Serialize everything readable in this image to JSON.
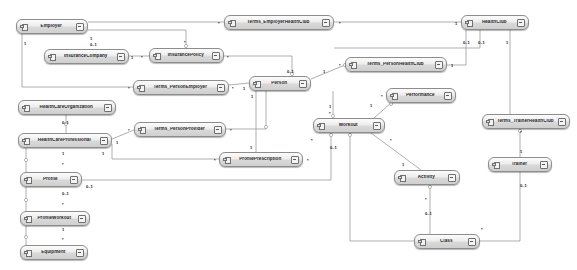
{
  "diagram": {
    "type": "uml-class-diagram",
    "canvas": {
      "width": 577,
      "height": 270,
      "background": "#ffffff"
    },
    "node_style": {
      "border": "#8d8d8d",
      "fill_top": "#fcfcfc",
      "fill_bottom": "#cfcfcf",
      "text": "#1d1d1d"
    },
    "edge_color": "#8c8c8c",
    "icons": {
      "class": "class-icon",
      "expand": "expand-icon"
    }
  },
  "nodes": [
    {
      "id": "employer",
      "label": "Employer",
      "x": 16,
      "y": 19,
      "w": 72
    },
    {
      "id": "terms_employerhealthclub",
      "label": "Terms_EmployerHealthClub",
      "x": 224,
      "y": 15,
      "w": 110
    },
    {
      "id": "healthclub",
      "label": "HealthClub",
      "x": 461,
      "y": 15,
      "w": 68
    },
    {
      "id": "insurancecompany",
      "label": "InsuranceCompany",
      "x": 44,
      "y": 49,
      "w": 85
    },
    {
      "id": "insurancepolicy",
      "label": "InsurancePolicy",
      "x": 149,
      "y": 48,
      "w": 75
    },
    {
      "id": "terms_personhealthclub",
      "label": "Terms_PersonHealthClub",
      "x": 345,
      "y": 57,
      "w": 102
    },
    {
      "id": "terms_personemployer",
      "label": "Terms_PersonEmployer",
      "x": 133,
      "y": 80,
      "w": 96
    },
    {
      "id": "person",
      "label": "Person",
      "x": 249,
      "y": 76,
      "w": 62
    },
    {
      "id": "performance",
      "label": "Performance",
      "x": 386,
      "y": 88,
      "w": 70
    },
    {
      "id": "healthcareorganization",
      "label": "HealthCareOrganization",
      "x": 18,
      "y": 100,
      "w": 98
    },
    {
      "id": "terms_trainerhealthclub",
      "label": "Terms_TrainerHealthClub",
      "x": 482,
      "y": 114,
      "w": 88
    },
    {
      "id": "workout",
      "label": "Workout",
      "x": 313,
      "y": 118,
      "w": 72
    },
    {
      "id": "terms_personprovider",
      "label": "Terms_PersonProvider",
      "x": 134,
      "y": 122,
      "w": 92
    },
    {
      "id": "healthcareprofessional",
      "label": "HealthCareProfessional",
      "x": 18,
      "y": 133,
      "w": 94
    },
    {
      "id": "profileprescription",
      "label": "ProfilePrescription",
      "x": 219,
      "y": 152,
      "w": 84
    },
    {
      "id": "profile",
      "label": "Profile",
      "x": 20,
      "y": 172,
      "w": 62
    },
    {
      "id": "trainer",
      "label": "Trainer",
      "x": 488,
      "y": 157,
      "w": 64
    },
    {
      "id": "activity",
      "label": "Activity",
      "x": 394,
      "y": 170,
      "w": 66
    },
    {
      "id": "profileworkout",
      "label": "ProfileWorkout",
      "x": 20,
      "y": 211,
      "w": 70
    },
    {
      "id": "class",
      "label": "Class",
      "x": 414,
      "y": 234,
      "w": 66
    },
    {
      "id": "equipment",
      "label": "Equipment",
      "x": 20,
      "y": 245,
      "w": 68
    }
  ],
  "multiplicities": [
    {
      "text": "1",
      "x": 90,
      "y": 37
    },
    {
      "text": "0..1",
      "x": 90,
      "y": 43
    },
    {
      "text": "1",
      "x": 24,
      "y": 42
    },
    {
      "text": "*",
      "x": 218,
      "y": 22
    },
    {
      "text": "*",
      "x": 339,
      "y": 22
    },
    {
      "text": "1",
      "x": 455,
      "y": 22
    },
    {
      "text": "*",
      "x": 184,
      "y": 41
    },
    {
      "text": "1",
      "x": 131,
      "y": 56
    },
    {
      "text": "*",
      "x": 141,
      "y": 56
    },
    {
      "text": "*",
      "x": 227,
      "y": 56
    },
    {
      "text": "0..1",
      "x": 463,
      "y": 41
    },
    {
      "text": "0..1",
      "x": 478,
      "y": 41
    },
    {
      "text": "1",
      "x": 506,
      "y": 41
    },
    {
      "text": "*",
      "x": 339,
      "y": 64
    },
    {
      "text": "1",
      "x": 451,
      "y": 64
    },
    {
      "text": "*",
      "x": 128,
      "y": 87
    },
    {
      "text": "*",
      "x": 232,
      "y": 87
    },
    {
      "text": "1",
      "x": 243,
      "y": 87
    },
    {
      "text": "0..1",
      "x": 287,
      "y": 70
    },
    {
      "text": "1",
      "x": 323,
      "y": 70
    },
    {
      "text": "*",
      "x": 381,
      "y": 95
    },
    {
      "text": "1",
      "x": 329,
      "y": 105
    },
    {
      "text": "*",
      "x": 329,
      "y": 112
    },
    {
      "text": "1",
      "x": 370,
      "y": 104
    },
    {
      "text": "1",
      "x": 251,
      "y": 95
    },
    {
      "text": "0..1",
      "x": 62,
      "y": 121
    },
    {
      "text": "*",
      "x": 128,
      "y": 129
    },
    {
      "text": "*",
      "x": 230,
      "y": 129
    },
    {
      "text": "1",
      "x": 116,
      "y": 141
    },
    {
      "text": "1",
      "x": 102,
      "y": 152
    },
    {
      "text": "1",
      "x": 62,
      "y": 152
    },
    {
      "text": "*",
      "x": 62,
      "y": 163
    },
    {
      "text": "*",
      "x": 214,
      "y": 159
    },
    {
      "text": "*",
      "x": 307,
      "y": 159
    },
    {
      "text": "1",
      "x": 250,
      "y": 146
    },
    {
      "text": "0..1",
      "x": 86,
      "y": 185
    },
    {
      "text": "*",
      "x": 311,
      "y": 139
    },
    {
      "text": "0..1",
      "x": 330,
      "y": 146
    },
    {
      "text": "*",
      "x": 390,
      "y": 139
    },
    {
      "text": "0..1",
      "x": 62,
      "y": 192
    },
    {
      "text": "*",
      "x": 62,
      "y": 203
    },
    {
      "text": "1",
      "x": 62,
      "y": 228
    },
    {
      "text": "*",
      "x": 62,
      "y": 238
    },
    {
      "text": "1",
      "x": 520,
      "y": 150
    },
    {
      "text": "*",
      "x": 520,
      "y": 131
    },
    {
      "text": "0..1",
      "x": 520,
      "y": 184
    },
    {
      "text": "1",
      "x": 402,
      "y": 163
    },
    {
      "text": "*",
      "x": 425,
      "y": 198
    },
    {
      "text": "0..1",
      "x": 425,
      "y": 212
    },
    {
      "text": "*",
      "x": 481,
      "y": 228
    }
  ],
  "edges": [
    {
      "from": "employer",
      "to": "terms_employerhealthclub",
      "points": "88,23 224,23"
    },
    {
      "from": "terms_employerhealthclub",
      "to": "healthclub",
      "points": "334,23 461,23"
    },
    {
      "from": "employer",
      "to": "insurancepolicy",
      "points": "88,31 186,31 186,48"
    },
    {
      "from": "insurancecompany",
      "to": "insurancepolicy",
      "points": "129,56 149,56"
    },
    {
      "from": "insurancepolicy",
      "to": "person",
      "points": "224,56 290,56 290,76"
    },
    {
      "from": "employer",
      "to": "terms_personemployer",
      "points": "22,34 22,87 133,87"
    },
    {
      "from": "terms_personemployer",
      "to": "person",
      "points": "229,87 249,83"
    },
    {
      "from": "person",
      "to": "terms_personhealthclub",
      "points": "311,80 345,64"
    },
    {
      "from": "terms_personhealthclub",
      "to": "healthclub",
      "points": "447,64 466,64 466,30"
    },
    {
      "from": "healthclub",
      "to": "healthclub2",
      "points": "481,30 481,48 334,48"
    },
    {
      "from": "healthclub",
      "to": "trainer_branch",
      "points": "509,30 509,114"
    },
    {
      "from": "person",
      "to": "workout",
      "points": "332,91 332,118"
    },
    {
      "from": "workout",
      "to": "performance",
      "points": "373,118 392,103"
    },
    {
      "from": "person",
      "to": "profileprescription",
      "points": "255,91 255,152"
    },
    {
      "from": "healthcareprofessional",
      "to": "terms_personprovider",
      "points": "112,140 134,129"
    },
    {
      "from": "terms_personprovider",
      "to": "person",
      "points": "226,129 265,129 265,91"
    },
    {
      "from": "healthcareorganization",
      "to": "healthcareprofessional",
      "points": "66,115 66,133"
    },
    {
      "from": "healthcareprofessional",
      "to": "profile",
      "points": "26,148 26,172"
    },
    {
      "from": "healthcareprofessional",
      "to": "profileprescription",
      "points": "112,145 112,158 219,158"
    },
    {
      "from": "profile",
      "to": "workout",
      "points": "82,180 330,180 330,133"
    },
    {
      "from": "profile",
      "to": "profileworkout",
      "points": "26,187 26,211"
    },
    {
      "from": "profileworkout",
      "to": "equipment",
      "points": "26,226 26,245"
    },
    {
      "from": "workout",
      "to": "activity",
      "points": "370,133 420,170"
    },
    {
      "from": "activity",
      "to": "class",
      "points": "430,185 430,234"
    },
    {
      "from": "trainer",
      "to": "class",
      "points": "520,172 520,241 480,241"
    },
    {
      "from": "terms_trainerhealthclub",
      "to": "trainer",
      "points": "520,129 520,157"
    },
    {
      "from": "workout",
      "to": "class2",
      "points": "349,133 349,241 414,241"
    }
  ]
}
